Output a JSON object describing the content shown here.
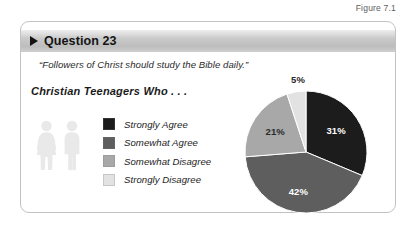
{
  "figure": {
    "label": "Figure 7.1"
  },
  "panel": {
    "header": {
      "title": "Question 23",
      "marker_icon": "triangle-right-icon"
    },
    "quote": "“Followers of Christ should study the Bible daily.”",
    "subtitle": "Christian Teenagers Who . . .",
    "people_icon": "two-people-icon"
  },
  "legend": {
    "items": [
      {
        "label": "Strongly Agree",
        "color": "#1c1c1c"
      },
      {
        "label": "Somewhat Agree",
        "color": "#5e5e5e"
      },
      {
        "label": "Somewhat Disagree",
        "color": "#a8a8a8"
      },
      {
        "label": "Strongly Disagree",
        "color": "#e2e2e2"
      }
    ]
  },
  "chart_data": {
    "type": "pie",
    "title": "Christian Teenagers Who . . .",
    "question": "Question 23",
    "statement": "“Followers of Christ should study the Bible daily.”",
    "categories": [
      "Strongly Agree",
      "Somewhat Agree",
      "Somewhat Disagree",
      "Strongly Disagree"
    ],
    "values": [
      31,
      42,
      21,
      5
    ],
    "value_labels": [
      "31%",
      "42%",
      "21%",
      "5%"
    ],
    "colors": [
      "#1c1c1c",
      "#5e5e5e",
      "#a8a8a8",
      "#e2e2e2"
    ],
    "units": "percent",
    "start_angle_deg": 0,
    "direction": "clockwise",
    "legend_position": "left",
    "grid": false,
    "xlabel": "",
    "ylabel": ""
  },
  "slice_labels": {
    "strongly_agree": "31%",
    "somewhat_agree": "42%",
    "somewhat_disagree": "21%",
    "strongly_disagree": "5%"
  }
}
